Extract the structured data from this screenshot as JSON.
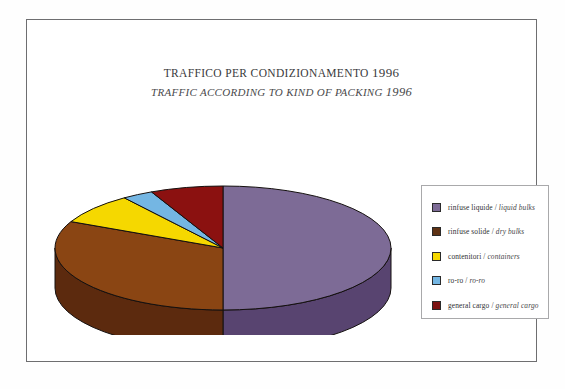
{
  "figure": {
    "title_it": "TRAFFICO PER CONDIZIONAMENTO",
    "title_it_year": "1996",
    "title_en": "TRAFFIC ACCORDING TO KIND OF PACKING",
    "title_en_year": "1996"
  },
  "legend": {
    "items": [
      {
        "label_it": "rinfuse liquide",
        "separator": "/",
        "label_en": "liquid bulks",
        "color": "#7d6b96"
      },
      {
        "label_it": "rinfuse solide",
        "separator": "/",
        "label_en": "dry bulks",
        "color": "#5e3214"
      },
      {
        "label_it": "contenitori",
        "separator": "/",
        "label_en": "containers",
        "color": "#f5d800"
      },
      {
        "label_it": "ro-ro",
        "separator": "/",
        "label_en": "ro-ro",
        "color": "#74b6e3"
      },
      {
        "label_it": "general cargo",
        "separator": "/",
        "label_en": "general cargo",
        "color": "#7c1312"
      }
    ]
  },
  "chart_data": {
    "type": "pie",
    "three_d": true,
    "legend_position": "right",
    "categories": [
      "rinfuse liquide / liquid bulks",
      "rinfuse solide / dry bulks",
      "contenitori / containers",
      "ro-ro / ro-ro",
      "general cargo / general cargo"
    ],
    "values": [
      50,
      32,
      8,
      3,
      7
    ],
    "unit": "percent",
    "colors": [
      "#7d6b96",
      "#8a4513",
      "#f5d800",
      "#74b6e3",
      "#8b1110"
    ],
    "side_colors": [
      "#584470",
      "#5c2a0e",
      "#b09b00",
      "#4c83a8",
      "#5d0c0b"
    ],
    "xlabel": "",
    "ylabel": ""
  }
}
